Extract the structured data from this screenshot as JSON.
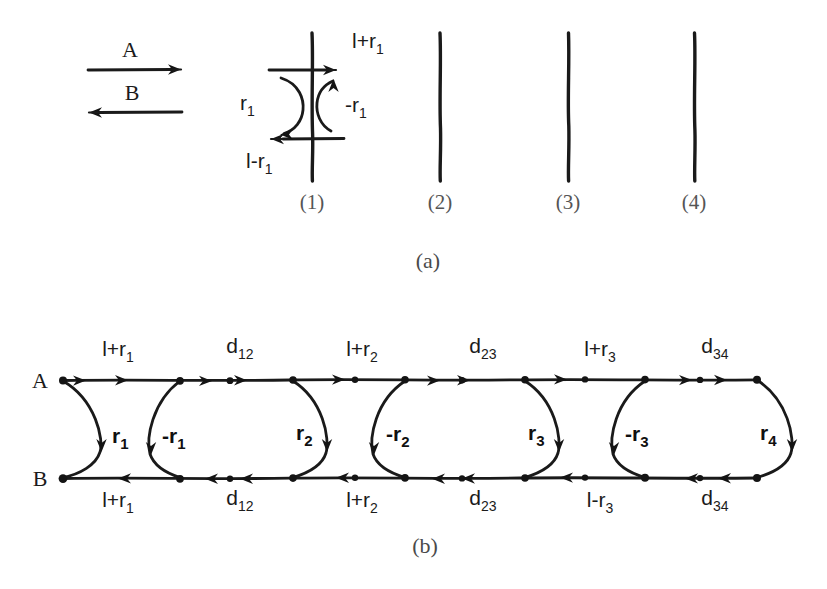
{
  "figure": {
    "panel_a": {
      "caption": "(a)",
      "legend": {
        "a_label": "A",
        "b_label": "B",
        "a_direction": "right",
        "b_direction": "left"
      },
      "interfaces": [
        {
          "number": "(1)",
          "x": 312
        },
        {
          "number": "(2)",
          "x": 440
        },
        {
          "number": "(3)",
          "x": 568
        },
        {
          "number": "(4)",
          "x": 694
        }
      ],
      "interface_1_labels": {
        "top_right": "l+r",
        "top_right_sub": "1",
        "left_arc": "r",
        "left_arc_sub": "1",
        "right_arc": "-r",
        "right_arc_sub": "1",
        "bottom_left": "l-r",
        "bottom_left_sub": "1"
      }
    },
    "panel_b": {
      "caption": "(b)",
      "row_a_label": "A",
      "row_b_label": "B",
      "top_labels": [
        {
          "text": "l+r",
          "sub": "1",
          "x": 118
        },
        {
          "text": "d",
          "sub": "12",
          "x": 240
        },
        {
          "text": "l+r",
          "sub": "2",
          "x": 362
        },
        {
          "text": "d",
          "sub": "23",
          "x": 483
        },
        {
          "text": "l+r",
          "sub": "3",
          "x": 600
        },
        {
          "text": "d",
          "sub": "34",
          "x": 715
        }
      ],
      "bottom_labels": [
        {
          "text": "l+r",
          "sub": "1",
          "x": 118
        },
        {
          "text": "d",
          "sub": "12",
          "x": 240
        },
        {
          "text": "l+r",
          "sub": "2",
          "x": 362
        },
        {
          "text": "d",
          "sub": "23",
          "x": 483
        },
        {
          "text": "l-r",
          "sub": "3",
          "x": 600
        },
        {
          "text": "d",
          "sub": "34",
          "x": 715
        }
      ],
      "arc_labels": [
        {
          "text": "r",
          "sub": "1",
          "x": 90,
          "y": 443
        },
        {
          "text": "-r",
          "sub": "1",
          "x": 188,
          "y": 443
        },
        {
          "text": "r",
          "sub": "2",
          "x": 310,
          "y": 443
        },
        {
          "text": "-r",
          "sub": "2",
          "x": 405,
          "y": 443
        },
        {
          "text": "r",
          "sub": "3",
          "x": 530,
          "y": 443
        },
        {
          "text": "-r",
          "sub": "3",
          "x": 625,
          "y": 443
        },
        {
          "text": "r",
          "sub": "4",
          "x": 748,
          "y": 443
        }
      ],
      "node_rows": {
        "line_a_y": 380,
        "line_b_y": 478,
        "node_x": [
          63,
          180,
          230,
          293,
          355,
          405,
          462,
          525,
          585,
          645,
          700,
          755
        ]
      }
    }
  },
  "colors": {
    "ink": "#1a1a1a",
    "paper": "#ffffff",
    "caption": "#4a4a4a"
  }
}
